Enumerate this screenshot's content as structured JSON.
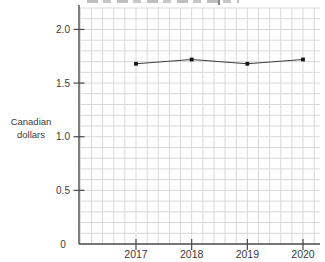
{
  "chart_data": {
    "type": "line",
    "title_clipped": true,
    "categories": [
      "2017",
      "2018",
      "2019",
      "2020"
    ],
    "values": [
      1.68,
      1.72,
      1.68,
      1.72
    ],
    "ylabel_lines": [
      "Canadian",
      "dollars"
    ],
    "x_tick_labels": [
      "2017",
      "2018",
      "2019",
      "2020"
    ],
    "y_tick_labels": [
      "2.0",
      "1.5",
      "1.0",
      "0.5",
      "0"
    ],
    "y_tick_values": [
      2.0,
      1.5,
      1.0,
      0.5,
      0
    ],
    "ylim": [
      0,
      2.2
    ],
    "minor_grid_step": 0.1,
    "grid": true,
    "legend": "none",
    "colors": {
      "grid": "#d9d9d9",
      "axis": "#4a4a4a",
      "line": "#3f3f3f",
      "marker": "#161616",
      "text": "#3a3a3a"
    }
  }
}
